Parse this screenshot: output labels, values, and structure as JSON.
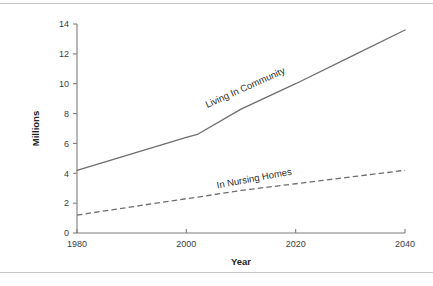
{
  "page": {
    "background_color": "#ffffff",
    "rule_color": "#c9c9c9",
    "top_rule": "",
    "bottom_rule": ""
  },
  "chart_data": {
    "type": "line",
    "title": "",
    "xlabel": "Year",
    "ylabel": "Millions",
    "xlim": [
      1980,
      2040
    ],
    "ylim": [
      0,
      14
    ],
    "xticks": [
      1980,
      2000,
      2020,
      2040
    ],
    "yticks": [
      0,
      2,
      4,
      6,
      8,
      10,
      12,
      14
    ],
    "xtick_labels": [
      "1980",
      "2000",
      "2020",
      "2040"
    ],
    "ytick_labels": [
      "0",
      "2",
      "4",
      "6",
      "8",
      "10",
      "12",
      "14"
    ],
    "grid": false,
    "legend_position": "inline-labels",
    "line_color": "#6e6e6e",
    "axis_color": "#7d7d7d",
    "x": [
      1980,
      1990,
      2000,
      2002,
      2010,
      2020,
      2030,
      2040
    ],
    "series": [
      {
        "name": "Living In Community",
        "style": "solid",
        "values": [
          4.2,
          5.3,
          6.4,
          6.6,
          8.3,
          10.0,
          11.8,
          13.6
        ]
      },
      {
        "name": "In Nursing Homes",
        "style": "dashed",
        "values": [
          1.2,
          1.75,
          2.3,
          2.4,
          2.85,
          3.3,
          3.75,
          4.2
        ]
      }
    ],
    "annotations": [
      {
        "text": "Living In Community",
        "x": 2011,
        "y": 9.55,
        "rotation": -24
      },
      {
        "text": "In Nursing Homes",
        "x": 2012.5,
        "y": 3.45,
        "rotation": -10.5
      }
    ]
  }
}
